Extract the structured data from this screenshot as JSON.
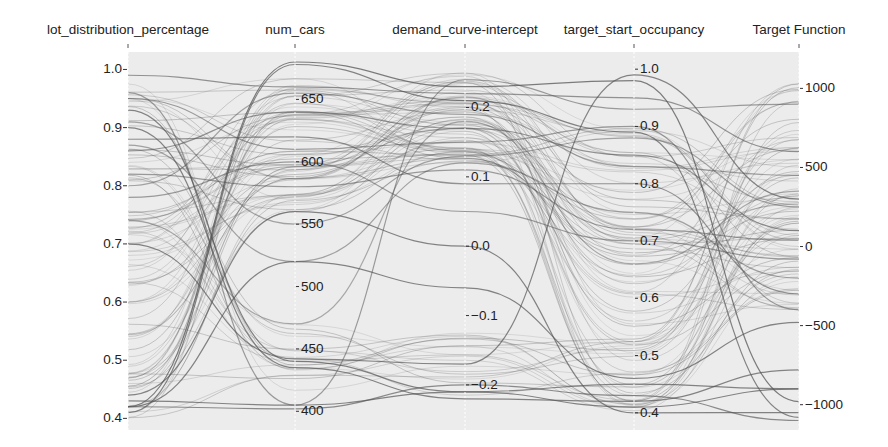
{
  "chart_data": {
    "type": "parallel_coordinates",
    "title": "",
    "plot_area": {
      "x0": 128,
      "x1": 799,
      "y0": 52,
      "y1": 430,
      "background": "#ececec"
    },
    "line_color": "#555555",
    "axes": [
      {
        "name": "lot_distribution_percentage",
        "x": 128,
        "side": "left",
        "range": [
          0.38,
          1.03
        ],
        "ticks": [
          1.0,
          0.9,
          0.8,
          0.7,
          0.6,
          0.5,
          0.4
        ],
        "tick_labels": [
          "1.0",
          "0.9",
          "0.8",
          "0.7",
          "0.6",
          "0.5",
          "0.4"
        ]
      },
      {
        "name": "num_cars",
        "x": 295,
        "side": "right",
        "range": [
          385,
          688
        ],
        "ticks": [
          650,
          600,
          550,
          500,
          450,
          400
        ],
        "tick_labels": [
          "650",
          "600",
          "550",
          "500",
          "450",
          "400"
        ]
      },
      {
        "name": "demand_curve-intercept",
        "x": 465,
        "side": "right",
        "range": [
          -0.265,
          0.28
        ],
        "ticks": [
          0.2,
          0.1,
          0.0,
          -0.1,
          -0.2
        ],
        "tick_labels": [
          "0.2",
          "0.1",
          "0.0",
          "−0.1",
          "−0.2"
        ]
      },
      {
        "name": "target_start_occupancy",
        "x": 634,
        "side": "right",
        "range": [
          0.37,
          1.03
        ],
        "ticks": [
          1.0,
          0.9,
          0.8,
          0.7,
          0.6,
          0.5,
          0.4
        ],
        "tick_labels": [
          "1.0",
          "0.9",
          "0.8",
          "0.7",
          "0.6",
          "0.5",
          "0.4"
        ]
      },
      {
        "name": "Target Function",
        "x": 799,
        "side": "right",
        "range": [
          -1160,
          1230
        ],
        "ticks": [
          1000,
          500,
          0,
          -500,
          -1000
        ],
        "tick_labels": [
          "1000",
          "500",
          "0",
          "−500",
          "−1000"
        ]
      }
    ],
    "series_highlighted": [
      {
        "values": [
          0.42,
          680,
          0.23,
          0.98,
          -980
        ],
        "opacity": 0.75
      },
      {
        "values": [
          0.41,
          678,
          0.21,
          0.89,
          -1080
        ],
        "opacity": 0.7
      },
      {
        "values": [
          0.99,
          660,
          0.22,
          0.95,
          600
        ],
        "opacity": 0.6
      },
      {
        "values": [
          0.96,
          405,
          0.24,
          0.93,
          900
        ],
        "opacity": 0.55
      },
      {
        "values": [
          0.93,
          440,
          -0.21,
          0.41,
          -900
        ],
        "opacity": 0.7
      },
      {
        "values": [
          0.9,
          435,
          -0.22,
          0.42,
          -780
        ],
        "opacity": 0.7
      },
      {
        "values": [
          0.7,
          442,
          -0.17,
          0.99,
          300
        ],
        "opacity": 0.7
      },
      {
        "values": [
          0.44,
          560,
          0.0,
          0.4,
          -1050
        ],
        "opacity": 0.7
      },
      {
        "values": [
          0.42,
          520,
          -0.06,
          0.46,
          -480
        ],
        "opacity": 0.7
      },
      {
        "values": [
          0.43,
          405,
          -0.21,
          0.45,
          -900
        ],
        "opacity": 0.7
      },
      {
        "values": [
          0.42,
          402,
          -0.2,
          0.43,
          -1100
        ],
        "opacity": 0.65
      },
      {
        "values": [
          0.88,
          620,
          0.09,
          0.8,
          -300
        ],
        "opacity": 0.6
      },
      {
        "values": [
          0.86,
          640,
          0.17,
          0.85,
          100
        ],
        "opacity": 0.6
      },
      {
        "values": [
          0.78,
          600,
          0.05,
          0.7,
          -80
        ],
        "opacity": 0.55
      },
      {
        "values": [
          0.82,
          580,
          0.11,
          0.72,
          40
        ],
        "opacity": 0.55
      },
      {
        "values": [
          0.95,
          610,
          0.15,
          0.9,
          -400
        ],
        "opacity": 0.55
      },
      {
        "values": [
          0.91,
          550,
          0.13,
          0.88,
          250
        ],
        "opacity": 0.5
      },
      {
        "values": [
          0.87,
          520,
          0.12,
          0.75,
          -200
        ],
        "opacity": 0.5
      },
      {
        "values": [
          0.8,
          655,
          0.19,
          0.83,
          450
        ],
        "opacity": 0.5
      },
      {
        "values": [
          0.74,
          470,
          0.18,
          0.66,
          350
        ],
        "opacity": 0.45
      }
    ],
    "series_faint": {
      "count": 90,
      "opacity": 0.22,
      "description": "dense background bundle of light-gray curves clustered near high num_cars / high demand intercept / mid target occupancy, with target function mostly between 0 and 1000"
    },
    "xlabel": "",
    "ylabel": "",
    "grid": false,
    "legend": null
  }
}
